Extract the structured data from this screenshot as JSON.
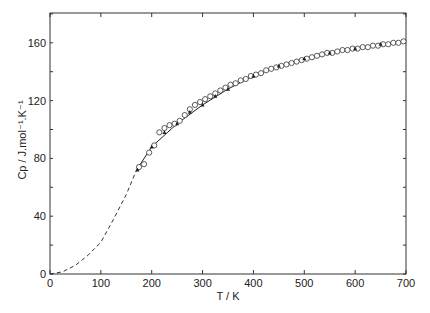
{
  "chart_data": {
    "type": "scatter",
    "title": "",
    "xlabel": "T / K",
    "ylabel": "Cp / J.mol⁻¹.K⁻¹",
    "xlim": [
      0,
      700
    ],
    "ylim": [
      0,
      180
    ],
    "x_ticks": [
      0,
      100,
      200,
      300,
      400,
      500,
      600,
      700
    ],
    "y_ticks": [
      0,
      40,
      80,
      120,
      160
    ],
    "grid": false,
    "legend": null,
    "series": [
      {
        "name": "experimental (open circles)",
        "marker": "open-circle",
        "x": [
          175,
          185,
          195,
          205,
          215,
          225,
          235,
          245,
          255,
          265,
          275,
          285,
          295,
          305,
          315,
          325,
          335,
          345,
          355,
          365,
          375,
          385,
          395,
          405,
          415,
          425,
          435,
          445,
          455,
          465,
          475,
          485,
          495,
          505,
          515,
          525,
          535,
          545,
          555,
          565,
          575,
          585,
          595,
          605,
          615,
          625,
          635,
          645,
          655,
          665,
          675,
          685,
          695
        ],
        "values": [
          74,
          76,
          84,
          89,
          98,
          101,
          103,
          104,
          106,
          110,
          114,
          117,
          119,
          121,
          123,
          125,
          127,
          129,
          131,
          132,
          134,
          135,
          137,
          138,
          139,
          141,
          142,
          143,
          144,
          145,
          146,
          147,
          148,
          149,
          150,
          151,
          152,
          153,
          153,
          154,
          155,
          155,
          156,
          156,
          157,
          157,
          158,
          158,
          159,
          159,
          160,
          160,
          161
        ]
      },
      {
        "name": "experimental (filled points)",
        "marker": "filled-triangle",
        "x": [
          172,
          200,
          225,
          250,
          275,
          300,
          325,
          350,
          400,
          450,
          500,
          550,
          600,
          650
        ],
        "values": [
          72,
          88,
          98,
          104,
          112,
          117,
          123,
          128,
          137,
          144,
          149,
          153,
          156,
          159
        ]
      },
      {
        "name": "fit (solid line)",
        "style": "solid",
        "x": [
          170,
          200,
          250,
          300,
          350,
          400,
          450,
          500,
          550,
          600,
          650,
          700
        ],
        "values": [
          72,
          88,
          104,
          117,
          128,
          137,
          144,
          149,
          153,
          156,
          159,
          161
        ]
      },
      {
        "name": "extrapolation (dashed line)",
        "style": "dashed",
        "x": [
          0,
          25,
          50,
          75,
          100,
          125,
          150,
          170
        ],
        "values": [
          0,
          1.5,
          6,
          13,
          22,
          38,
          55,
          72
        ]
      }
    ]
  },
  "axes": {
    "x_label": "T / K",
    "y_label": "Cp / J.mol⁻¹.K⁻¹",
    "x_tick_labels": [
      "0",
      "100",
      "200",
      "300",
      "400",
      "500",
      "600",
      "700"
    ],
    "y_tick_labels": [
      "0",
      "40",
      "80",
      "120",
      "160"
    ]
  }
}
